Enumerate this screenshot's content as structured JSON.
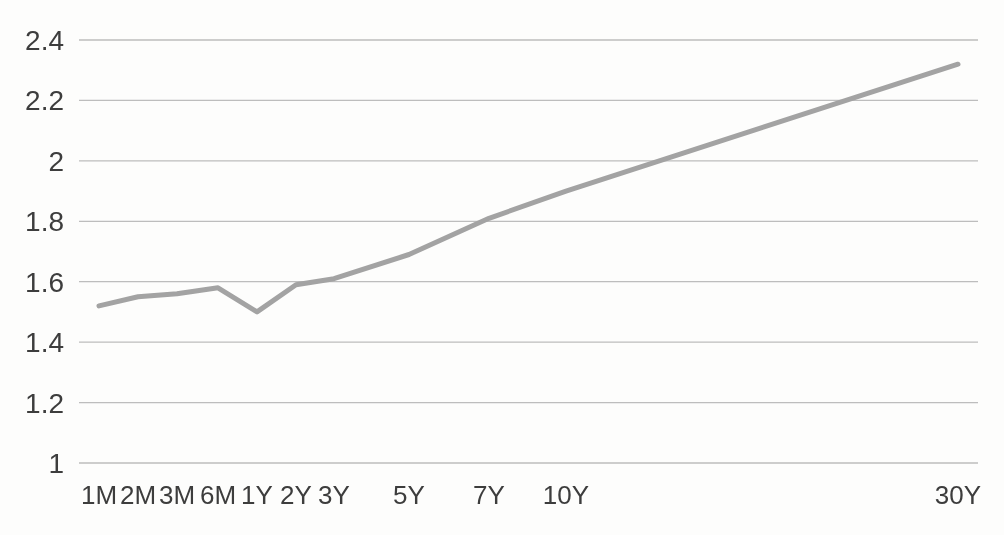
{
  "chart_data": {
    "type": "line",
    "title": "",
    "xlabel": "",
    "ylabel": "",
    "legend": "none",
    "grid": "horizontal",
    "categories": [
      "1M",
      "2M",
      "3M",
      "6M",
      "1Y",
      "2Y",
      "3Y",
      "5Y",
      "7Y",
      "10Y",
      "30Y"
    ],
    "series": [
      {
        "name": "yield-curve",
        "values": [
          1.52,
          1.55,
          1.56,
          1.58,
          1.5,
          1.59,
          1.61,
          1.69,
          1.81,
          1.9,
          2.32
        ]
      }
    ],
    "ylim": [
      1,
      2.4
    ],
    "y_tick_values": [
      2.4,
      2.2,
      2,
      1.8,
      1.6,
      1.4,
      1.2,
      1
    ],
    "y_tick_labels": [
      "2.4",
      "2.2",
      "2",
      "1.8",
      "1.6",
      "1.4",
      "1.2",
      "1"
    ],
    "colors": {
      "line": "#a3a3a3",
      "gridline": "#bdbdbd",
      "text": "#3d3d3d",
      "background": "#fdfdfc"
    },
    "layout": {
      "width": 1004,
      "height": 535,
      "x_px": [
        99,
        138,
        177,
        218,
        257,
        296,
        334,
        409,
        489,
        566,
        958
      ],
      "plot_left": 79,
      "plot_right": 978,
      "y_top_px": 40,
      "y_bottom_px": 463,
      "x_label_baseline_px": 504,
      "y_label_right_px": 64,
      "line_width": 5,
      "gridline_width": 1.3
    }
  }
}
